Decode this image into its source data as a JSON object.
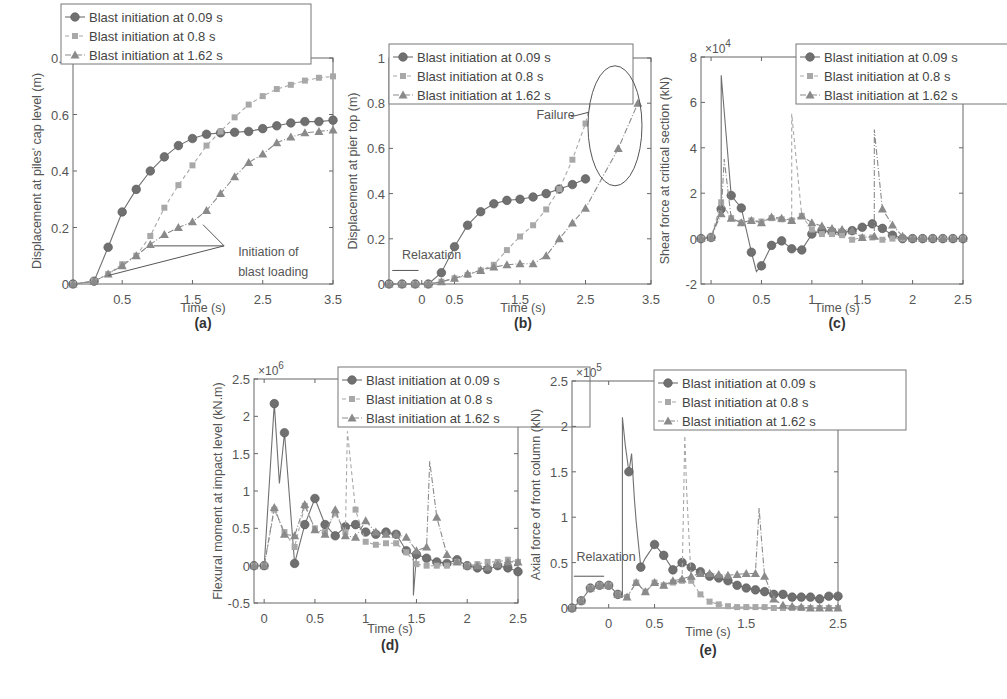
{
  "figure": {
    "legend_entries": [
      "Blast initiation at 0.09 s",
      "Blast initiation at 0.8 s",
      "Blast initiation at 1.62 s"
    ],
    "series_styles": [
      {
        "name": "Blast initiation at 0.09 s",
        "marker": "circle",
        "line": "solid",
        "color": "#707070"
      },
      {
        "name": "Blast initiation at 0.8 s",
        "marker": "square",
        "line": "dashed",
        "color": "#a8a8a8"
      },
      {
        "name": "Blast initiation at 1.62 s",
        "marker": "triangle",
        "line": "dashdot",
        "color": "#8a8a8a"
      }
    ]
  },
  "chart_data": [
    {
      "id": "a",
      "panel_label": "(a)",
      "type": "line",
      "title": "",
      "xlabel": "Time (s)",
      "ylabel": "Displacement at piles' cap level (m)",
      "xlim": [
        -0.2,
        3.5
      ],
      "ylim": [
        0,
        0.8
      ],
      "xticks": [
        0.5,
        1.5,
        2.5,
        3.5
      ],
      "yticks": [
        0,
        0.2,
        0.4,
        0.6,
        0.8
      ],
      "ytick_labels": [
        "0",
        "0.2",
        "0.4",
        "0.6",
        "0.8"
      ],
      "exponent": "",
      "legend_position": "top-left",
      "annotations": [
        {
          "text": "Initiation of",
          "x": 2.15,
          "y": 0.1
        },
        {
          "text": "blast loading",
          "x": 2.15,
          "y": 0.03
        }
      ],
      "series": [
        {
          "name": "Blast initiation at 0.09 s",
          "x": [
            -0.2,
            0.1,
            0.3,
            0.5,
            0.7,
            0.9,
            1.1,
            1.3,
            1.5,
            1.7,
            1.9,
            2.1,
            2.3,
            2.5,
            2.7,
            2.9,
            3.1,
            3.3,
            3.5
          ],
          "y": [
            0,
            0.01,
            0.13,
            0.255,
            0.335,
            0.4,
            0.45,
            0.49,
            0.515,
            0.53,
            0.535,
            0.537,
            0.54,
            0.55,
            0.56,
            0.57,
            0.575,
            0.575,
            0.58
          ]
        },
        {
          "name": "Blast initiation at 0.8 s",
          "x": [
            -0.2,
            0.1,
            0.3,
            0.5,
            0.7,
            0.9,
            1.1,
            1.3,
            1.5,
            1.7,
            1.9,
            2.1,
            2.3,
            2.5,
            2.7,
            2.9,
            3.1,
            3.3,
            3.5
          ],
          "y": [
            0,
            0.01,
            0.035,
            0.07,
            0.1,
            0.17,
            0.27,
            0.35,
            0.42,
            0.49,
            0.54,
            0.59,
            0.635,
            0.665,
            0.69,
            0.705,
            0.72,
            0.73,
            0.735
          ]
        },
        {
          "name": "Blast initiation at 1.62 s",
          "x": [
            -0.2,
            0.1,
            0.3,
            0.5,
            0.7,
            0.9,
            1.1,
            1.3,
            1.5,
            1.7,
            1.9,
            2.1,
            2.3,
            2.5,
            2.7,
            2.9,
            3.1,
            3.3,
            3.5
          ],
          "y": [
            0,
            0.01,
            0.035,
            0.065,
            0.1,
            0.14,
            0.175,
            0.2,
            0.22,
            0.26,
            0.32,
            0.38,
            0.43,
            0.46,
            0.5,
            0.52,
            0.535,
            0.54,
            0.545
          ]
        }
      ]
    },
    {
      "id": "b",
      "panel_label": "(b)",
      "type": "line",
      "title": "",
      "xlabel": "Time (s)",
      "ylabel": "Displacement at pier top (m)",
      "xlim": [
        -0.5,
        3.5
      ],
      "ylim": [
        0,
        1
      ],
      "xticks": [
        0,
        0.5,
        1.5,
        2.5,
        3.5
      ],
      "yticks": [
        0,
        0.2,
        0.4,
        0.6,
        0.8,
        1
      ],
      "ytick_labels": [
        "0",
        "0.2",
        "0.4",
        "0.6",
        "0.8",
        "1"
      ],
      "exponent": "",
      "legend_position": "top-left",
      "annotations": [
        {
          "text": "Relaxation",
          "x": -0.3,
          "y": 0.11
        },
        {
          "text": "Failure",
          "x": 1.75,
          "y": 0.73
        }
      ],
      "series": [
        {
          "name": "Blast initiation at 0.09 s",
          "x": [
            -0.5,
            -0.3,
            -0.1,
            0.1,
            0.3,
            0.5,
            0.7,
            0.9,
            1.1,
            1.3,
            1.5,
            1.7,
            1.9,
            2.1,
            2.3,
            2.5
          ],
          "y": [
            0,
            0,
            0,
            0,
            0.05,
            0.165,
            0.26,
            0.32,
            0.355,
            0.37,
            0.375,
            0.385,
            0.4,
            0.42,
            0.44,
            0.465
          ]
        },
        {
          "name": "Blast initiation at 0.8 s",
          "x": [
            -0.5,
            -0.3,
            -0.1,
            0.1,
            0.3,
            0.5,
            0.7,
            0.9,
            1.1,
            1.3,
            1.5,
            1.7,
            1.9,
            2.1,
            2.3,
            2.5,
            2.75
          ],
          "y": [
            0,
            0,
            0,
            0,
            0.01,
            0.025,
            0.04,
            0.06,
            0.085,
            0.15,
            0.21,
            0.26,
            0.33,
            0.42,
            0.55,
            0.71,
            1.0
          ]
        },
        {
          "name": "Blast initiation at 1.62 s",
          "x": [
            -0.5,
            -0.3,
            -0.1,
            0.1,
            0.3,
            0.5,
            0.7,
            0.9,
            1.1,
            1.3,
            1.5,
            1.7,
            1.9,
            2.1,
            2.3,
            2.5,
            3.0,
            3.3
          ],
          "y": [
            0,
            0,
            0,
            0,
            0.01,
            0.025,
            0.045,
            0.06,
            0.075,
            0.085,
            0.09,
            0.09,
            0.125,
            0.2,
            0.27,
            0.335,
            0.6,
            0.8
          ]
        }
      ]
    },
    {
      "id": "c",
      "panel_label": "(c)",
      "type": "line",
      "title": "",
      "xlabel": "Time (s)",
      "ylabel": "Shear force at critical section (kN)",
      "xlim": [
        -0.1,
        2.5
      ],
      "ylim": [
        -2,
        8
      ],
      "xticks": [
        0,
        0.5,
        1,
        1.5,
        2,
        2.5
      ],
      "yticks": [
        -2,
        0,
        2,
        4,
        6,
        8
      ],
      "ytick_labels": [
        "-2",
        "0",
        "2",
        "4",
        "6",
        "8"
      ],
      "exponent": "×10^4",
      "legend_position": "top-right",
      "annotations": [],
      "series": [
        {
          "name": "Blast initiation at 0.09 s",
          "x": [
            -0.1,
            0,
            0.1,
            0.1,
            0.2,
            0.3,
            0.4,
            0.45,
            0.5,
            0.6,
            0.7,
            0.8,
            0.9,
            1.0,
            1.1,
            1.2,
            1.3,
            1.4,
            1.5,
            1.6,
            1.7,
            1.8,
            1.9,
            2.0,
            2.1,
            2.2,
            2.3,
            2.4,
            2.5
          ],
          "y": [
            0,
            0.05,
            1.3,
            7.2,
            1.9,
            1.35,
            -0.6,
            -1.45,
            -1.2,
            -0.3,
            -0.1,
            -0.45,
            -0.5,
            0.2,
            0.35,
            0.3,
            0.25,
            0.35,
            0.5,
            0.65,
            0.45,
            0.15,
            0,
            0,
            0,
            0,
            0,
            0,
            0
          ]
        },
        {
          "name": "Blast initiation at 0.8 s",
          "x": [
            -0.1,
            0,
            0.1,
            0.2,
            0.3,
            0.4,
            0.5,
            0.6,
            0.7,
            0.8,
            0.8,
            0.9,
            1.0,
            1.1,
            1.2,
            1.3,
            1.4,
            1.5,
            1.6,
            1.7,
            1.8,
            1.9,
            2.0,
            2.1,
            2.2,
            2.3,
            2.4,
            2.5
          ],
          "y": [
            0,
            0.05,
            1.6,
            0.9,
            0.7,
            0.8,
            0.75,
            0.9,
            0.85,
            0.8,
            5.5,
            1.0,
            0.4,
            0.2,
            0.2,
            0.15,
            -0.05,
            0.05,
            0.05,
            -0.05,
            0,
            0,
            0,
            0,
            0,
            0,
            0,
            0
          ]
        },
        {
          "name": "Blast initiation at 1.62 s",
          "x": [
            -0.1,
            0,
            0.1,
            0.13,
            0.2,
            0.3,
            0.4,
            0.5,
            0.6,
            0.7,
            0.8,
            0.9,
            1.0,
            1.1,
            1.2,
            1.3,
            1.4,
            1.5,
            1.62,
            1.62,
            1.7,
            1.8,
            1.9,
            2.0,
            2.1,
            2.2,
            2.3,
            2.4,
            2.5
          ],
          "y": [
            0,
            0.05,
            1.1,
            3.5,
            0.9,
            0.7,
            0.8,
            0.7,
            0.95,
            0.9,
            0.8,
            1.0,
            0.7,
            0.55,
            0.45,
            0.4,
            0.35,
            0.05,
            0.1,
            4.8,
            1.3,
            0.6,
            0.1,
            0,
            0,
            0,
            0,
            0,
            0
          ]
        }
      ]
    },
    {
      "id": "d",
      "panel_label": "(d)",
      "type": "line",
      "title": "",
      "xlabel": "Time (s)",
      "ylabel": "Flexural moment at impact level (kN.m)",
      "xlim": [
        -0.1,
        2.5
      ],
      "ylim": [
        -0.5,
        2.5
      ],
      "xticks": [
        0,
        0.5,
        1,
        1.5,
        2,
        2.5
      ],
      "yticks": [
        -0.5,
        0,
        0.5,
        1,
        1.5,
        2,
        2.5
      ],
      "ytick_labels": [
        "-0.5",
        "0",
        "0.5",
        "1",
        "1.5",
        "2",
        "2.5"
      ],
      "exponent": "×10^6",
      "legend_position": "top-right",
      "annotations": [],
      "series": [
        {
          "name": "Blast initiation at 0.09 s",
          "x": [
            -0.1,
            0,
            0.1,
            0.15,
            0.2,
            0.3,
            0.4,
            0.5,
            0.6,
            0.7,
            0.8,
            0.9,
            1.0,
            1.1,
            1.2,
            1.3,
            1.4,
            1.47,
            1.47,
            1.5,
            1.6,
            1.7,
            1.8,
            1.9,
            2.0,
            2.1,
            2.2,
            2.3,
            2.4,
            2.5
          ],
          "y": [
            0,
            0,
            2.17,
            1.1,
            1.78,
            0.03,
            0.55,
            0.9,
            0.55,
            0.4,
            0.52,
            0.55,
            0.45,
            0.42,
            0.45,
            0.42,
            0.2,
            0.15,
            -0.4,
            0.15,
            0.1,
            0.05,
            0.03,
            0.08,
            0,
            -0.03,
            -0.05,
            0,
            -0.03,
            -0.08
          ]
        },
        {
          "name": "Blast initiation at 0.8 s",
          "x": [
            -0.1,
            0,
            0.1,
            0.2,
            0.3,
            0.4,
            0.5,
            0.6,
            0.7,
            0.8,
            0.82,
            0.9,
            1.0,
            1.1,
            1.2,
            1.3,
            1.4,
            1.5,
            1.6,
            1.7,
            1.8,
            1.9,
            2.0,
            2.1,
            2.2,
            2.3,
            2.4,
            2.5
          ],
          "y": [
            0,
            0,
            0.75,
            0.45,
            0.25,
            0.8,
            0.5,
            0.45,
            0.7,
            0.45,
            1.8,
            0.75,
            0.32,
            0.28,
            0.3,
            0.3,
            0.18,
            0.02,
            0.0,
            0.0,
            0.0,
            0.05,
            0,
            0.02,
            0.05,
            0.05,
            0.08,
            0.05
          ]
        },
        {
          "name": "Blast initiation at 1.62 s",
          "x": [
            -0.1,
            0,
            0.1,
            0.2,
            0.3,
            0.4,
            0.5,
            0.6,
            0.7,
            0.8,
            0.9,
            1.0,
            1.1,
            1.2,
            1.3,
            1.4,
            1.5,
            1.6,
            1.63,
            1.7,
            1.8,
            1.9,
            2.0,
            2.1,
            2.2,
            2.3,
            2.4,
            2.5
          ],
          "y": [
            0,
            0,
            0.78,
            0.42,
            0.4,
            0.82,
            0.48,
            0.42,
            0.75,
            0.4,
            0.38,
            0.6,
            0.45,
            0.42,
            0.42,
            0.38,
            0.2,
            0.25,
            1.4,
            0.65,
            0.15,
            0.05,
            0,
            0,
            -0.02,
            0.02,
            0.05,
            0.05
          ]
        }
      ]
    },
    {
      "id": "e",
      "panel_label": "(e)",
      "type": "line",
      "title": "",
      "xlabel": "Time (s)",
      "ylabel": "Axial force of front column (kN)",
      "xlim": [
        -0.4,
        2.5
      ],
      "ylim": [
        0,
        2.5
      ],
      "xticks": [
        0,
        0.5,
        1.5,
        2.5
      ],
      "yticks": [
        0,
        0.5,
        1,
        1.5,
        2,
        2.5
      ],
      "ytick_labels": [
        "0",
        "0.5",
        "1",
        "1.5",
        "2",
        "2.5"
      ],
      "exponent": "×10^5",
      "legend_position": "top-right",
      "annotations": [
        {
          "text": "Relaxation",
          "x": -0.35,
          "y": 0.52
        }
      ],
      "series": [
        {
          "name": "Blast initiation at 0.09 s",
          "x": [
            -0.4,
            -0.3,
            -0.2,
            -0.1,
            0,
            0.1,
            0.15,
            0.15,
            0.18,
            0.22,
            0.25,
            0.28,
            0.3,
            0.35,
            0.4,
            0.5,
            0.6,
            0.7,
            0.8,
            0.9,
            1.0,
            1.1,
            1.2,
            1.3,
            1.4,
            1.5,
            1.6,
            1.7,
            1.8,
            1.9,
            2.0,
            2.1,
            2.2,
            2.3,
            2.4,
            2.5
          ],
          "y": [
            0,
            0.08,
            0.22,
            0.25,
            0.25,
            0.15,
            0.12,
            2.1,
            1.8,
            1.5,
            1.7,
            1.2,
            0.95,
            0.45,
            0.55,
            0.7,
            0.58,
            0.42,
            0.5,
            0.45,
            0.4,
            0.35,
            0.33,
            0.3,
            0.25,
            0.22,
            0.2,
            0.18,
            0.15,
            0.15,
            0.12,
            0.12,
            0.12,
            0.1,
            0.13,
            0.13
          ]
        },
        {
          "name": "Blast initiation at 0.8 s",
          "x": [
            -0.4,
            -0.3,
            -0.2,
            -0.1,
            0,
            0.1,
            0.2,
            0.3,
            0.4,
            0.5,
            0.6,
            0.7,
            0.8,
            0.83,
            0.85,
            0.9,
            1.0,
            1.1,
            1.2,
            1.3,
            1.4,
            1.5,
            1.6,
            1.7,
            1.8,
            1.9,
            2.0,
            2.1,
            2.2,
            2.3,
            2.4,
            2.5
          ],
          "y": [
            0,
            0.08,
            0.22,
            0.25,
            0.25,
            0.15,
            0.12,
            0.28,
            0.18,
            0.28,
            0.25,
            0.28,
            0.3,
            1.9,
            1.28,
            0.3,
            0.15,
            0.07,
            0.04,
            0.02,
            0.01,
            0.01,
            0.01,
            0.01,
            0,
            0,
            0,
            0,
            0,
            0,
            0,
            0
          ]
        },
        {
          "name": "Blast initiation at 1.62 s",
          "x": [
            -0.4,
            -0.3,
            -0.2,
            -0.1,
            0,
            0.1,
            0.2,
            0.3,
            0.4,
            0.5,
            0.6,
            0.7,
            0.8,
            0.9,
            1.0,
            1.1,
            1.2,
            1.3,
            1.4,
            1.5,
            1.6,
            1.64,
            1.67,
            1.7,
            1.8,
            1.9,
            2.0,
            2.1,
            2.2,
            2.3,
            2.4,
            2.5
          ],
          "y": [
            0,
            0.08,
            0.22,
            0.25,
            0.25,
            0.15,
            0.12,
            0.28,
            0.18,
            0.28,
            0.25,
            0.3,
            0.32,
            0.35,
            0.38,
            0.38,
            0.37,
            0.36,
            0.37,
            0.38,
            0.38,
            1.1,
            0.7,
            0.35,
            0.1,
            0.03,
            0.02,
            0.01,
            0,
            0,
            0,
            0
          ]
        }
      ]
    }
  ]
}
